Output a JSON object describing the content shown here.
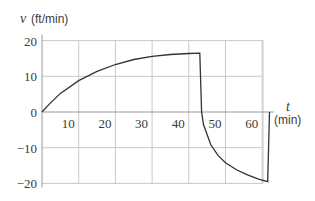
{
  "chart_data": {
    "type": "line",
    "title": "",
    "xlabel": "t",
    "xlabel_unit": "(min)",
    "ylabel": "v",
    "ylabel_unit": "(ft/min)",
    "xlim": [
      0,
      62
    ],
    "ylim": [
      -20,
      20
    ],
    "x_ticks": [
      10,
      20,
      30,
      40,
      50,
      60
    ],
    "x_tick_labels": [
      "10",
      "20",
      "30",
      "40",
      "50",
      "60"
    ],
    "y_ticks": [
      20,
      10,
      0,
      -10,
      -20
    ],
    "y_tick_labels": [
      "20",
      "10",
      "0",
      "−10",
      "−20"
    ],
    "grid": true,
    "legend": null,
    "series": [
      {
        "name": "v(t)",
        "x": [
          0,
          2,
          5,
          10,
          15,
          20,
          25,
          30,
          35,
          40,
          43,
          43.5,
          44,
          46,
          48,
          50,
          53,
          56,
          59,
          61.5,
          62
        ],
        "values": [
          0,
          2.2,
          5.2,
          8.8,
          11.4,
          13.3,
          14.7,
          15.6,
          16.1,
          16.4,
          16.5,
          0,
          -3.5,
          -9.2,
          -12.2,
          -14.2,
          -16.2,
          -17.6,
          -18.8,
          -19.5,
          0
        ]
      }
    ],
    "colors": {
      "curve": "#333333",
      "grid": "#c8c8c8",
      "text": "#3a3a3a"
    }
  }
}
